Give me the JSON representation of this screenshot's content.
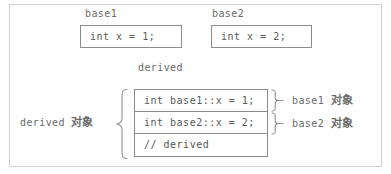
{
  "diagram": {
    "title_note": "C++ multiple inheritance object layout",
    "colors": {
      "frame_border": "#d2d2d2",
      "box_border": "#8c8c8c",
      "text": "#585858",
      "label_text": "#6b6b6b",
      "brace": "#8f8f8f",
      "background": "#fefefe"
    },
    "base_classes": [
      {
        "label": "base1",
        "code": "int x = 1;"
      },
      {
        "label": "base2",
        "code": "int x = 2;"
      }
    ],
    "derived": {
      "label": "derived",
      "object_label": "derived 对象",
      "rows": [
        {
          "code": "int base1::x = 1;",
          "annotation": "base1 对象"
        },
        {
          "code": "int base2::x = 2;",
          "annotation": "base2 对象"
        },
        {
          "code": "// derived",
          "annotation": ""
        }
      ]
    }
  }
}
